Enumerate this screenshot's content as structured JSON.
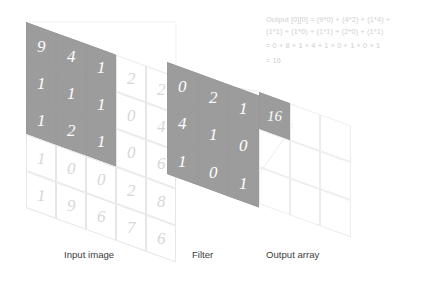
{
  "diagram": {
    "type": "cnn-convolution"
  },
  "chart_data": {
    "type": "heatmap",
    "xlabel": "",
    "ylabel": "",
    "grid": true,
    "legend": "none",
    "panels": [
      {
        "name": "Input image",
        "rows": 5,
        "cols": 5,
        "values": [
          [
            9,
            4,
            1,
            2,
            2
          ],
          [
            1,
            1,
            1,
            0,
            4
          ],
          [
            1,
            2,
            1,
            0,
            6
          ],
          [
            1,
            0,
            0,
            2,
            8
          ],
          [
            1,
            9,
            6,
            7,
            6
          ]
        ],
        "highlight": {
          "row_start": 0,
          "col_start": 0,
          "rows": 3,
          "cols": 3,
          "values": [
            [
              9,
              4,
              1
            ],
            [
              1,
              1,
              1
            ],
            [
              1,
              2,
              1
            ]
          ]
        }
      },
      {
        "name": "Filter",
        "rows": 3,
        "cols": 3,
        "values": [
          [
            0,
            2,
            1
          ],
          [
            4,
            1,
            0
          ],
          [
            1,
            0,
            1
          ]
        ],
        "highlight": {
          "row_start": 0,
          "col_start": 0,
          "rows": 3,
          "cols": 3,
          "values": [
            [
              0,
              2,
              1
            ],
            [
              4,
              1,
              0
            ],
            [
              1,
              0,
              1
            ]
          ]
        }
      },
      {
        "name": "Output array",
        "rows": 3,
        "cols": 3,
        "values": [
          [
            16,
            null,
            null
          ],
          [
            null,
            null,
            null
          ],
          [
            null,
            null,
            null
          ]
        ],
        "highlight": {
          "row_start": 0,
          "col_start": 0,
          "rows": 1,
          "cols": 1,
          "values": [
            [
              16
            ]
          ]
        }
      }
    ]
  },
  "colors": {
    "cell_dark_bg": "#9c9c9c",
    "cell_dark_text": "#ffffff",
    "cell_faint_text": "#d7d7d7",
    "grid_line": "#e6e6e6",
    "equation_text": "#cfcfcf",
    "caption_text": "#3d3d3d",
    "background": "#ffffff"
  },
  "input_grid": {
    "label": "Input image",
    "cells": [
      {
        "v": "9",
        "state": "dark"
      },
      {
        "v": "4",
        "state": "dark"
      },
      {
        "v": "1",
        "state": "dark"
      },
      {
        "v": "2",
        "state": "faint"
      },
      {
        "v": "2",
        "state": "faint"
      },
      {
        "v": "1",
        "state": "dark"
      },
      {
        "v": "1",
        "state": "dark"
      },
      {
        "v": "1",
        "state": "dark"
      },
      {
        "v": "0",
        "state": "faint"
      },
      {
        "v": "4",
        "state": "faint"
      },
      {
        "v": "1",
        "state": "dark"
      },
      {
        "v": "2",
        "state": "dark"
      },
      {
        "v": "1",
        "state": "dark"
      },
      {
        "v": "0",
        "state": "faint"
      },
      {
        "v": "6",
        "state": "faint"
      },
      {
        "v": "1",
        "state": "faint"
      },
      {
        "v": "0",
        "state": "faint"
      },
      {
        "v": "0",
        "state": "faint"
      },
      {
        "v": "2",
        "state": "faint"
      },
      {
        "v": "8",
        "state": "faint"
      },
      {
        "v": "1",
        "state": "faint"
      },
      {
        "v": "9",
        "state": "faint"
      },
      {
        "v": "6",
        "state": "faint"
      },
      {
        "v": "7",
        "state": "faint"
      },
      {
        "v": "6",
        "state": "faint"
      }
    ]
  },
  "filter_grid": {
    "label": "Filter",
    "cells": [
      {
        "v": "0",
        "state": "dark"
      },
      {
        "v": "2",
        "state": "dark"
      },
      {
        "v": "1",
        "state": "dark"
      },
      {
        "v": "4",
        "state": "dark"
      },
      {
        "v": "1",
        "state": "dark"
      },
      {
        "v": "0",
        "state": "dark"
      },
      {
        "v": "1",
        "state": "dark"
      },
      {
        "v": "0",
        "state": "dark"
      },
      {
        "v": "1",
        "state": "dark"
      }
    ]
  },
  "output_grid": {
    "label": "Output array",
    "cells": [
      {
        "v": "16",
        "state": "dark"
      },
      {
        "v": "",
        "state": "blank"
      },
      {
        "v": "",
        "state": "blank"
      },
      {
        "v": "",
        "state": "blank"
      },
      {
        "v": "",
        "state": "blank"
      },
      {
        "v": "",
        "state": "blank"
      },
      {
        "v": "",
        "state": "blank"
      },
      {
        "v": "",
        "state": "blank"
      },
      {
        "v": "",
        "state": "blank"
      }
    ]
  },
  "equation": {
    "line1": "Output [0][0] = (9*0) + (4*2) + (1*4) +",
    "line2": "(1*1) + (1*0) + (1*1) + (2*0) + (1*1)",
    "line3": "= 0 + 8 + 1 + 4 + 1 + 0 + 1 + 0 + 1",
    "line4": "= 16"
  },
  "captions": {
    "input": "Input image",
    "filter": "Filter",
    "output": "Output array"
  }
}
